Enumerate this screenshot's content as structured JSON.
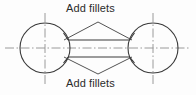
{
  "figure": {
    "type": "engineering-drawing",
    "background_color": "#fdfdfd",
    "outline_color": "#3a3a3a",
    "centerline_color": "#8a8a8a",
    "leader_color": "#4a4a4a",
    "text_color": "#2b2b2b"
  },
  "annotations": {
    "top_note": "Add fillets",
    "bottom_note": "Add fillets"
  },
  "geometry": {
    "left_circle": {
      "cx": 45,
      "cy": 48,
      "r": 25
    },
    "right_circle": {
      "cx": 153,
      "cy": 48,
      "r": 25
    },
    "web": {
      "x_start": 68,
      "x_end": 130,
      "y_top": 40,
      "y_bottom": 57
    },
    "horizontal_centerline": {
      "x_start": 5,
      "x_end": 191,
      "y": 48
    },
    "left_vertical_centerline": {
      "x": 45,
      "y_start": 13,
      "y_end": 84
    },
    "right_vertical_centerline": {
      "x": 153,
      "y_start": 13,
      "y_end": 84
    },
    "top_leader_apex": {
      "x": 98,
      "y": 22
    },
    "bottom_leader_apex": {
      "x": 98,
      "y": 74
    }
  }
}
